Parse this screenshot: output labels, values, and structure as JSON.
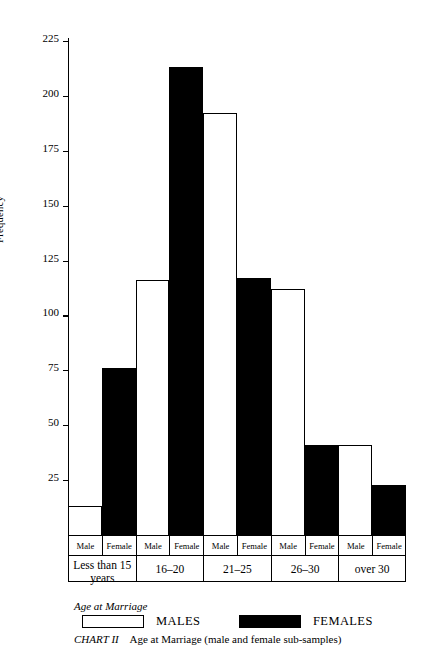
{
  "chart_data": {
    "type": "bar",
    "title": "CHART II   Age at Marriage (male and female sub-samples)",
    "caption_label": "CHART II",
    "caption_text": "Age at Marriage (male and female sub-samples)",
    "xlabel": "Age at Marriage",
    "ylabel": "Frequency",
    "ylim": [
      0,
      225
    ],
    "yticks": [
      25,
      50,
      75,
      100,
      125,
      150,
      175,
      200,
      225
    ],
    "ytick_labels": [
      "25",
      "50",
      "75",
      "100",
      "125",
      "150",
      "175",
      "200",
      "225"
    ],
    "grid": false,
    "legend": [
      "MALES",
      "FEMALES"
    ],
    "legend_position": "below-axis",
    "categories": [
      "Less than 15 years",
      "16–20",
      "21–25",
      "26–30",
      "over 30"
    ],
    "sub_labels": [
      "Male",
      "Female"
    ],
    "series": [
      {
        "name": "MALES",
        "fill": "#ffffff",
        "values": [
          13,
          116,
          192,
          112,
          41
        ]
      },
      {
        "name": "FEMALES",
        "fill": "#000000",
        "values": [
          76,
          213,
          117,
          41,
          23
        ]
      }
    ]
  },
  "axis": {
    "y_title": "Frequency",
    "x_title": "Age at Marriage"
  },
  "legend": {
    "males_label": "MALES",
    "females_label": "FEMALES"
  },
  "caption": {
    "chart_number": "CHART II",
    "chart_text": "Age at Marriage (male and female sub-samples)"
  },
  "groups": [
    {
      "label": "Less than 15 years",
      "label_line1": "Less than 15",
      "label_line2": "years",
      "male_label": "Male",
      "female_label": "Female",
      "male": 13,
      "female": 76
    },
    {
      "label": "16–20",
      "label_line1": "16–20",
      "label_line2": "",
      "male_label": "Male",
      "female_label": "Female",
      "male": 116,
      "female": 213
    },
    {
      "label": "21–25",
      "label_line1": "21–25",
      "label_line2": "",
      "male_label": "Male",
      "female_label": "Female",
      "male": 192,
      "female": 117
    },
    {
      "label": "26–30",
      "label_line1": "26–30",
      "label_line2": "",
      "male_label": "Male",
      "female_label": "Female",
      "male": 112,
      "female": 41
    },
    {
      "label": "over 30",
      "label_line1": "over 30",
      "label_line2": "",
      "male_label": "Male",
      "female_label": "Female",
      "male": 41,
      "female": 23
    }
  ],
  "colors": {
    "male_fill": "#ffffff",
    "female_fill": "#000000",
    "axis": "#000000",
    "background": "#ffffff"
  }
}
